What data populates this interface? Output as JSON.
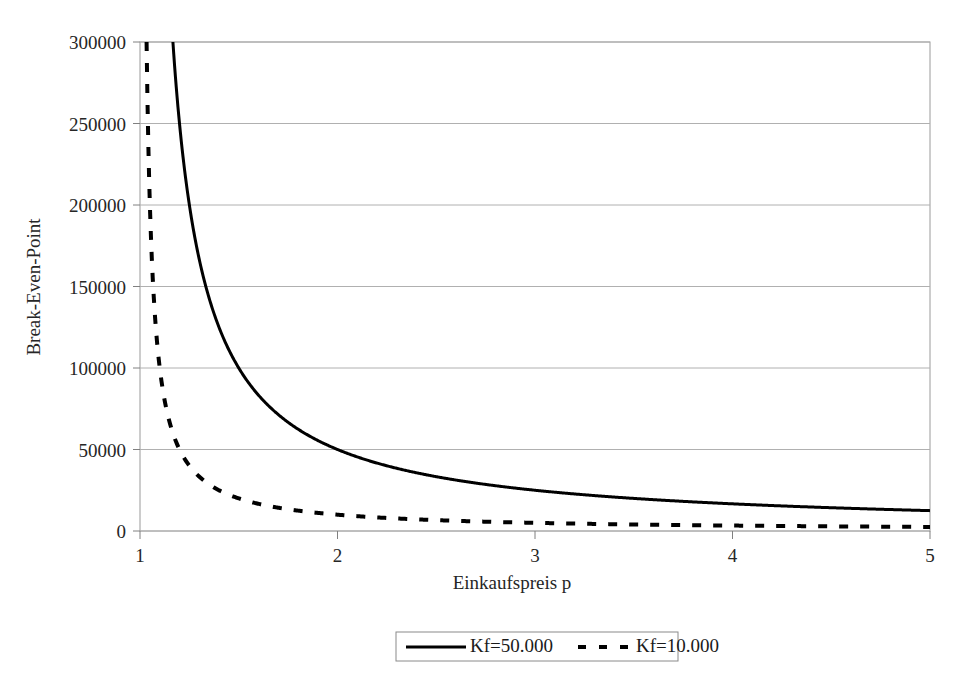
{
  "chart_data": {
    "type": "line",
    "title": "",
    "xlabel": "Einkaufspreis p",
    "ylabel": "Break-Even-Point",
    "xlim": [
      1,
      5
    ],
    "ylim": [
      0,
      300000
    ],
    "grid": true,
    "legend_position": "bottom",
    "x_ticks": [
      "1",
      "2",
      "3",
      "4",
      "5"
    ],
    "x_tick_values": [
      1,
      2,
      3,
      4,
      5
    ],
    "y_ticks": [
      "0",
      "50000",
      "100000",
      "150000",
      "200000",
      "250000",
      "300000"
    ],
    "y_tick_values": [
      0,
      50000,
      100000,
      150000,
      200000,
      250000,
      300000
    ],
    "formula": "BEP = Kf / (p - 1)",
    "series": [
      {
        "name": "Kf=50.000",
        "style": "solid",
        "color": "#000000",
        "fixed_cost": 50000,
        "x": [
          1.17,
          1.2,
          1.25,
          1.3,
          1.4,
          1.5,
          1.6,
          1.75,
          2.0,
          2.25,
          2.5,
          2.75,
          3.0,
          3.25,
          3.5,
          3.75,
          4.0,
          4.25,
          4.5,
          4.75,
          5.0
        ],
        "values": [
          294118,
          250000,
          200000,
          166667,
          125000,
          100000,
          83333,
          66667,
          50000,
          40000,
          33333,
          28571,
          25000,
          22222,
          20000,
          18182,
          16667,
          15385,
          14286,
          13333,
          12500
        ]
      },
      {
        "name": "Kf=10.000",
        "style": "dashed",
        "color": "#000000",
        "fixed_cost": 10000,
        "x": [
          1.1,
          1.15,
          1.2,
          1.25,
          1.3,
          1.4,
          1.5,
          1.6,
          1.75,
          2.0,
          2.25,
          2.5,
          2.75,
          3.0,
          3.25,
          3.5,
          3.75,
          4.0,
          4.25,
          4.5,
          4.75,
          5.0
        ],
        "values": [
          100000,
          66667,
          50000,
          40000,
          33333,
          25000,
          20000,
          16667,
          13333,
          10000,
          8000,
          6667,
          5714,
          5000,
          4444,
          4000,
          3636,
          3333,
          3077,
          2857,
          2667,
          2500
        ]
      }
    ],
    "legend": [
      {
        "label": "Kf=50.000",
        "style": "solid"
      },
      {
        "label": "Kf=10.000",
        "style": "dashed"
      }
    ]
  },
  "axis": {
    "y_title": "Break-Even-Point",
    "x_title": "Einkaufspreis p",
    "y_tick_0": "0",
    "y_tick_1": "50000",
    "y_tick_2": "100000",
    "y_tick_3": "150000",
    "y_tick_4": "200000",
    "y_tick_5": "250000",
    "y_tick_6": "300000",
    "x_tick_0": "1",
    "x_tick_1": "2",
    "x_tick_2": "3",
    "x_tick_3": "4",
    "x_tick_4": "5"
  },
  "legend": {
    "entry_1_label": "Kf=50.000",
    "entry_2_label": "Kf=10.000"
  },
  "colors": {
    "series_line": "#000000",
    "gridline": "#b0b0b0",
    "axis": "#808080",
    "text": "#1a1a1a",
    "background": "#ffffff"
  }
}
